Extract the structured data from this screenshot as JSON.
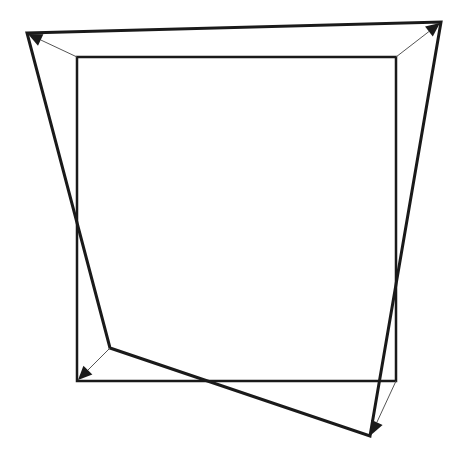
{
  "diagram": {
    "type": "geometric-transformation",
    "colors": {
      "background": "#ffffff",
      "stroke": "#1a1a1a",
      "thin_stroke": "#555555"
    },
    "square": {
      "points": [
        [
          77,
          57
        ],
        [
          396,
          57
        ],
        [
          396,
          381
        ],
        [
          77,
          381
        ]
      ],
      "stroke_width": 2.5
    },
    "quadrilateral": {
      "points": [
        [
          27,
          33
        ],
        [
          441,
          22
        ],
        [
          370,
          436
        ],
        [
          110,
          348
        ]
      ],
      "stroke_width": 3
    },
    "arrows": [
      {
        "name": "top-left",
        "from": [
          77,
          57
        ],
        "to": [
          28,
          34
        ]
      },
      {
        "name": "top-right",
        "from": [
          396,
          57
        ],
        "to": [
          440,
          23
        ]
      },
      {
        "name": "bottom-right",
        "from": [
          396,
          381
        ],
        "to": [
          371,
          435
        ]
      },
      {
        "name": "bottom-left",
        "from": [
          110,
          348
        ],
        "to": [
          78,
          380
        ]
      }
    ],
    "arrow_stroke_width": 1,
    "arrowhead_size": 14
  }
}
